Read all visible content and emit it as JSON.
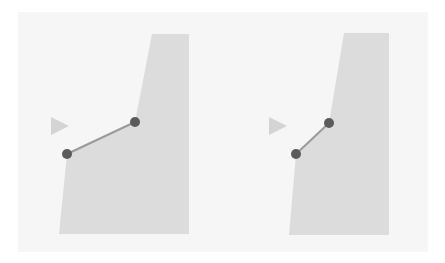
{
  "canvas": {
    "width": 445,
    "height": 263,
    "background": "#ffffff",
    "panel_fill": "#f6f6f6"
  },
  "colors": {
    "shape": "#dcdcdc",
    "arrow": "#d4d4d4",
    "point": "#5b5b5b",
    "segment": "#9a9a9a"
  },
  "panels": [
    {
      "name": "left",
      "shape_points": "152,34 189,34 189,234 59,234 67,154 135,122",
      "arrow_points": "51,117 69,126 51,135",
      "segment": {
        "x1": 67,
        "y1": 154,
        "x2": 135,
        "y2": 122
      },
      "points": [
        {
          "cx": 67,
          "cy": 154
        },
        {
          "cx": 135,
          "cy": 122
        }
      ]
    },
    {
      "name": "right",
      "shape_points": "344,33 389,33 389,235 289,235 296,154 329,123",
      "arrow_points": "269,117 287,126 269,135",
      "segment": {
        "x1": 296,
        "y1": 154,
        "x2": 329,
        "y2": 123
      },
      "points": [
        {
          "cx": 296,
          "cy": 154
        },
        {
          "cx": 329,
          "cy": 123
        }
      ]
    }
  ]
}
